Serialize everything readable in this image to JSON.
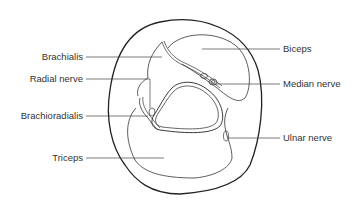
{
  "diagram": {
    "title": "",
    "colors": {
      "stroke": "#222222",
      "leader": "#444444",
      "text": "#333333",
      "background": "#ffffff"
    },
    "labels": {
      "left": [
        {
          "id": "brachialis",
          "text": "Brachialis"
        },
        {
          "id": "radial_nerve",
          "text": "Radial nerve"
        },
        {
          "id": "brachioradialis",
          "text": "Brachioradialis"
        },
        {
          "id": "triceps",
          "text": "Triceps"
        }
      ],
      "right": [
        {
          "id": "biceps",
          "text": "Biceps"
        },
        {
          "id": "median_nerve",
          "text": "Median nerve"
        },
        {
          "id": "ulnar_nerve",
          "text": "Ulnar nerve"
        }
      ]
    }
  }
}
